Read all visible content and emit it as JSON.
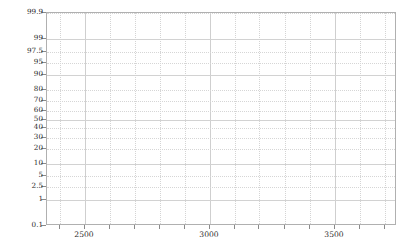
{
  "chart_data": {
    "type": "scatter",
    "title": "",
    "subtitle": "",
    "xlabel": "",
    "ylabel": "",
    "plot_kind": "normal-probability-plot",
    "grid": true,
    "legend": null,
    "annotations": [],
    "series": [],
    "data_points": [],
    "x_axis": {
      "scale": "linear",
      "xlim": [
        2350,
        3750
      ],
      "tick_labels": [
        "2500",
        "3000",
        "3500"
      ],
      "tick_values": [
        2500,
        3000,
        3500
      ],
      "minor_tick_step": 100
    },
    "y_axis": {
      "scale": "normal-probability",
      "unit": "percent",
      "ylim": [
        0.1,
        99.9
      ],
      "tick_labels": [
        "99.9",
        "99",
        "97.5",
        "95",
        "90",
        "80",
        "70",
        "60",
        "50",
        "40",
        "30",
        "20",
        "10",
        "5",
        "2.5",
        "1",
        "0.1"
      ],
      "tick_values": [
        99.9,
        99,
        97.5,
        95,
        90,
        80,
        70,
        60,
        50,
        40,
        30,
        20,
        10,
        5,
        2.5,
        1,
        0.1
      ]
    },
    "colors": {
      "background": "#ffffff",
      "frame": "#b0b0b0",
      "grid_major": "#cfcfcf",
      "grid_minor": "#d6d6d6",
      "tick_label": "#2b2b2b"
    }
  }
}
